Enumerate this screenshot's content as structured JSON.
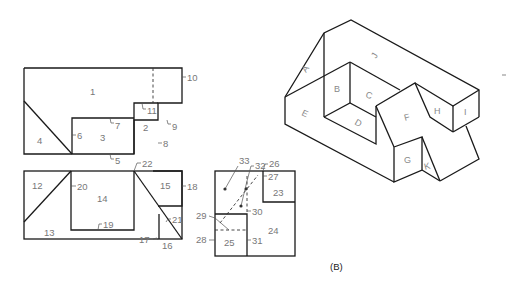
{
  "figure": {
    "caption": "(B)",
    "top_view": {
      "regions": [
        "1",
        "2",
        "3",
        "4"
      ],
      "callouts": [
        "5",
        "6",
        "7",
        "8",
        "9",
        "10",
        "11"
      ]
    },
    "front_view": {
      "regions": [
        "12",
        "13",
        "14",
        "15",
        "16"
      ],
      "callouts": [
        "17",
        "18",
        "19",
        "20",
        "21",
        "22"
      ]
    },
    "side_view": {
      "regions": [
        "23",
        "24",
        "25"
      ],
      "callouts": [
        "26",
        "27",
        "28",
        "29",
        "30",
        "31",
        "32",
        "33"
      ]
    },
    "isometric": {
      "faces": [
        "A",
        "B",
        "C",
        "D",
        "E",
        "F",
        "G",
        "H",
        "I",
        "J",
        "K"
      ]
    },
    "colors": {
      "line": "#1a1a1a",
      "label": "#777777"
    }
  }
}
